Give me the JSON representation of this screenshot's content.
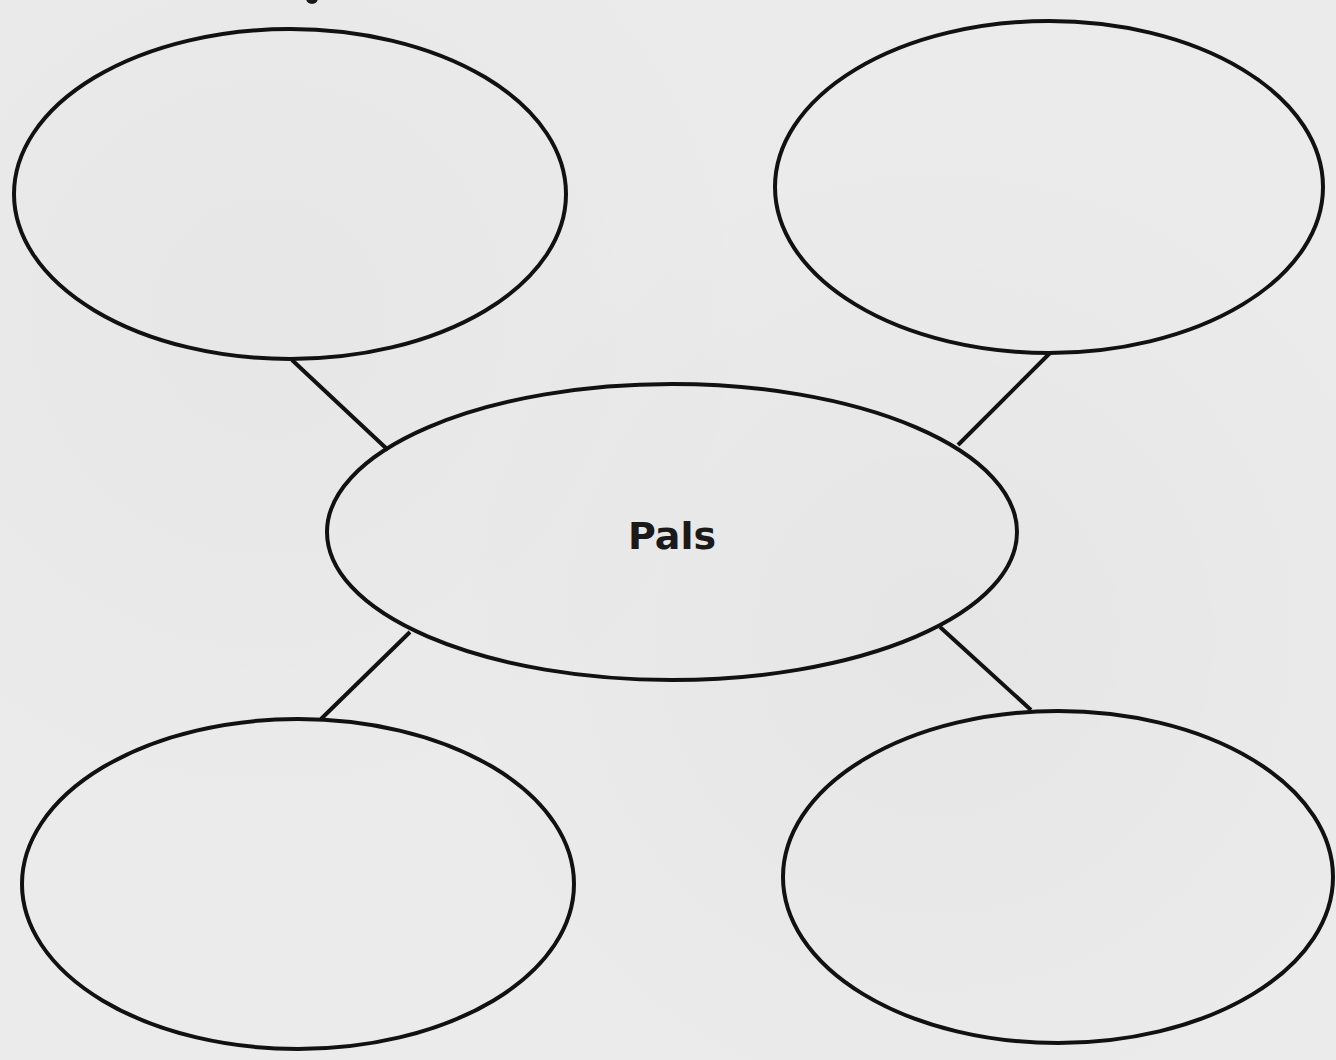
{
  "diagram": {
    "type": "word-web",
    "center": {
      "label": "Pals",
      "cx": 672,
      "cy": 532,
      "rx": 345,
      "ry": 148
    },
    "nodes": [
      {
        "id": "top-left",
        "label": "",
        "cx": 290,
        "cy": 194,
        "rx": 276,
        "ry": 165
      },
      {
        "id": "top-right",
        "label": "",
        "cx": 1049,
        "cy": 187,
        "rx": 274,
        "ry": 166
      },
      {
        "id": "bottom-left",
        "label": "",
        "cx": 298,
        "cy": 884,
        "rx": 276,
        "ry": 165
      },
      {
        "id": "bottom-right",
        "label": "",
        "cx": 1058,
        "cy": 877,
        "rx": 275,
        "ry": 166
      }
    ],
    "connectors": [
      {
        "from": "top-left",
        "x1": 292,
        "y1": 360,
        "x2": 388,
        "y2": 450
      },
      {
        "from": "top-right",
        "x1": 1050,
        "y1": 353,
        "x2": 958,
        "y2": 445
      },
      {
        "from": "bottom-left",
        "x1": 410,
        "y1": 632,
        "x2": 321,
        "y2": 719
      },
      {
        "from": "bottom-right",
        "x1": 940,
        "y1": 627,
        "x2": 1031,
        "y2": 710
      }
    ],
    "stroke_color": "#111111",
    "background_color": "#ebebeb"
  }
}
